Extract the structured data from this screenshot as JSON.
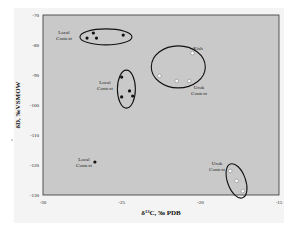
{
  "chart_data": {
    "type": "scatter",
    "title": "",
    "xlabel": "δ13C, ‰ PDB",
    "xlabel_parts": {
      "delta": "δ",
      "sup": "13",
      "rest": "C, ‰ PDB"
    },
    "ylabel": "δD, ‰VSMOW",
    "xlim": [
      -30,
      -15
    ],
    "ylim": [
      -130,
      -70
    ],
    "xticks": [
      -30,
      -25,
      -20,
      -15
    ],
    "xtick_labels": [
      "-30",
      "-25",
      "-20",
      "-15"
    ],
    "yticks": [
      -70,
      -80,
      -90,
      -100,
      -110,
      -120,
      -130
    ],
    "ytick_labels": [
      "-70",
      "-80",
      "-90",
      "-100",
      "-110",
      "-120",
      "-130"
    ],
    "grid": false,
    "legend": null,
    "colors": {
      "plot_bg": "#c9c9c9",
      "frame": "#333333",
      "filled_marker": "#111111",
      "open_marker": "#ffffff"
    },
    "series": [
      {
        "name": "Local Context (group 1)",
        "marker": "filled",
        "points": [
          [
            -27.2,
            -77.7
          ],
          [
            -26.8,
            -76.0
          ],
          [
            -26.6,
            -77.7
          ],
          [
            -24.9,
            -76.7
          ]
        ],
        "enclosure": {
          "cx": -26.0,
          "cy": -77.3,
          "rx_px": 26,
          "ry_px": 8,
          "rotate": 0
        }
      },
      {
        "name": "Local Context (group 2)",
        "marker": "filled",
        "points": [
          [
            -25.0,
            -90.7
          ],
          [
            -24.5,
            -95.3
          ],
          [
            -25.0,
            -97.3
          ],
          [
            -24.3,
            -97.0
          ]
        ],
        "enclosure": {
          "cx": -24.7,
          "cy": -94.7,
          "rx_px": 9,
          "ry_px": 19,
          "rotate": 0
        }
      },
      {
        "name": "Kish / Uruk Context",
        "marker": "open",
        "points": [
          [
            -20.5,
            -82.7
          ],
          [
            -22.6,
            -90.3
          ],
          [
            -21.5,
            -92.0
          ],
          [
            -20.7,
            -92.0
          ]
        ],
        "enclosure": {
          "cx": -21.4,
          "cy": -87.3,
          "rx_px": 27,
          "ry_px": 21,
          "rotate": 0
        }
      },
      {
        "name": "Uruk Context",
        "marker": "open",
        "points": [
          [
            -18.1,
            -122.0
          ],
          [
            -17.7,
            -125.3
          ],
          [
            -17.3,
            -128.7
          ]
        ],
        "enclosure": {
          "cx": -17.7,
          "cy": -125.3,
          "rx_px": 9,
          "ry_px": 18,
          "rotate": -20
        }
      },
      {
        "name": "Local Context (single)",
        "marker": "filled",
        "points": [
          [
            -26.7,
            -119.0
          ]
        ],
        "enclosure": null
      }
    ],
    "annotations": [
      {
        "text": [
          "Local",
          "Context"
        ],
        "x_px": 64,
        "y_px": 34,
        "anchor": "middle"
      },
      {
        "text": [
          "Local",
          "Context"
        ],
        "x_px": 105,
        "y_px": 84,
        "anchor": "middle"
      },
      {
        "text": [
          "Kish"
        ],
        "x_px": 198,
        "y_px": 50,
        "anchor": "middle"
      },
      {
        "text": [
          "Uruk",
          "Context"
        ],
        "x_px": 199,
        "y_px": 89,
        "anchor": "middle"
      },
      {
        "text": [
          "Uruk",
          "Context"
        ],
        "x_px": 217,
        "y_px": 165,
        "anchor": "middle"
      },
      {
        "text": [
          "Local",
          "Context"
        ],
        "x_px": 84,
        "y_px": 161,
        "anchor": "middle"
      }
    ]
  }
}
